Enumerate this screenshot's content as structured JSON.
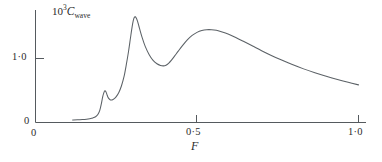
{
  "figure": {
    "name": "wave-resistance-coefficient-plot",
    "background": "#ffffff",
    "curve_color": "#5b6166",
    "axis_color": "#555a5e"
  },
  "axes": {
    "y_label_prefix": "10",
    "y_label_exponent": "3",
    "y_label_symbol": "C",
    "y_label_subscript": "wave",
    "y_label_full": "10³C_wave",
    "x_label": "F",
    "y_ticks": [
      {
        "value": 0,
        "text": "0"
      },
      {
        "value": 1.0,
        "text": "1·0"
      }
    ],
    "x_ticks": [
      {
        "value": 0,
        "text": "0"
      },
      {
        "value": 0.5,
        "text": "0·5"
      },
      {
        "value": 1.0,
        "text": "1·0"
      }
    ]
  },
  "chart_data": {
    "type": "line",
    "title": "",
    "subtitle": "",
    "xlabel": "F",
    "ylabel": "10³C_wave",
    "xlim": [
      0,
      1.0
    ],
    "ylim": [
      0,
      2.05
    ],
    "grid": false,
    "legend": null,
    "annotations": [],
    "series": [
      {
        "name": "C_wave",
        "color": "#5b6166",
        "x": [
          0.115,
          0.13,
          0.145,
          0.158,
          0.168,
          0.178,
          0.186,
          0.193,
          0.199,
          0.204,
          0.208,
          0.212,
          0.215,
          0.218,
          0.221,
          0.224,
          0.228,
          0.232,
          0.237,
          0.243,
          0.25,
          0.258,
          0.266,
          0.274,
          0.281,
          0.288,
          0.294,
          0.299,
          0.303,
          0.307,
          0.311,
          0.316,
          0.322,
          0.33,
          0.34,
          0.352,
          0.364,
          0.376,
          0.387,
          0.396,
          0.404,
          0.412,
          0.421,
          0.431,
          0.442,
          0.455,
          0.47,
          0.485,
          0.5,
          0.515,
          0.53,
          0.545,
          0.56,
          0.578,
          0.598,
          0.62,
          0.645,
          0.672,
          0.7,
          0.73,
          0.762,
          0.795,
          0.83,
          0.865,
          0.9,
          0.935,
          0.968,
          1.0
        ],
        "y": [
          0.04,
          0.042,
          0.046,
          0.052,
          0.06,
          0.072,
          0.09,
          0.125,
          0.19,
          0.295,
          0.4,
          0.47,
          0.495,
          0.48,
          0.44,
          0.4,
          0.368,
          0.352,
          0.352,
          0.368,
          0.405,
          0.47,
          0.57,
          0.715,
          0.9,
          1.11,
          1.32,
          1.49,
          1.6,
          1.65,
          1.64,
          1.58,
          1.47,
          1.33,
          1.185,
          1.06,
          0.972,
          0.918,
          0.892,
          0.885,
          0.895,
          0.925,
          0.975,
          1.04,
          1.115,
          1.2,
          1.29,
          1.36,
          1.408,
          1.437,
          1.45,
          1.45,
          1.44,
          1.415,
          1.378,
          1.328,
          1.265,
          1.195,
          1.122,
          1.048,
          0.975,
          0.905,
          0.838,
          0.778,
          0.723,
          0.672,
          0.628,
          0.588
        ]
      }
    ],
    "features": {
      "precursor_bump_x": 0.215,
      "precursor_bump_y": 0.5,
      "main_peak_x": 0.305,
      "main_peak_y": 1.65,
      "valley_x": 0.392,
      "valley_y": 0.885,
      "broad_hump_x": 0.525,
      "broad_hump_y": 1.45,
      "tail_end_x": 1.0,
      "tail_end_y": 0.59
    }
  }
}
